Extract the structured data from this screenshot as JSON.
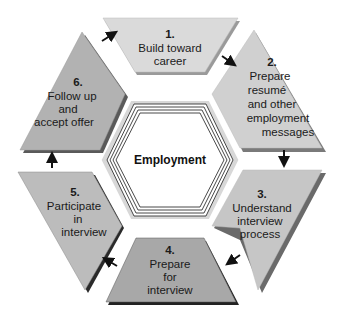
{
  "diagram": {
    "center_label": "Employment",
    "segments": [
      {
        "number": "1.",
        "lines": [
          "Build toward",
          "career"
        ],
        "color": "#dadada"
      },
      {
        "number": "2.",
        "lines": [
          "Prepare",
          "resumé",
          "and other",
          "employment",
          "messages"
        ],
        "color": "#d0d0d0"
      },
      {
        "number": "3.",
        "lines": [
          "Understand",
          "interview",
          "process"
        ],
        "color": "#c6c6c6"
      },
      {
        "number": "4.",
        "lines": [
          "Prepare",
          "for",
          "interview"
        ],
        "color": "#a8a8a8"
      },
      {
        "number": "5.",
        "lines": [
          "Participate",
          "in",
          "interview"
        ],
        "color": "#bcbcbc"
      },
      {
        "number": "6.",
        "lines": [
          "Follow up",
          "and",
          "accept offer"
        ],
        "color": "#b2b2b2"
      }
    ],
    "arrows": [
      "1-to-2",
      "2-to-3",
      "3-to-4",
      "4-to-5",
      "5-to-6",
      "6-to-1"
    ]
  }
}
